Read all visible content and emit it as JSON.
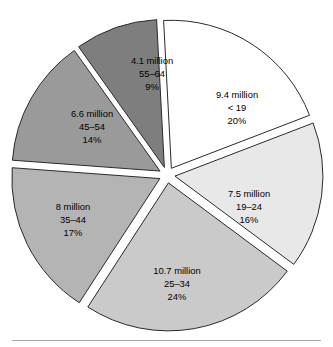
{
  "chart_data": {
    "type": "pie",
    "title": "",
    "subtitle": "",
    "xlabel": "",
    "ylabel": "",
    "legend_position": "none",
    "grid": false,
    "labels_inside_slices": true,
    "exploded": true,
    "units": "million",
    "categories": [
      "< 19",
      "19–24",
      "25–34",
      "35–44",
      "45–54",
      "55–64"
    ],
    "values": [
      9.4,
      7.5,
      10.7,
      8,
      6.6,
      4.1
    ],
    "percentages": [
      20,
      16,
      24,
      17,
      14,
      9
    ],
    "colors": [
      "#ffffff",
      "#e8e8e8",
      "#cacaca",
      "#b4b4b4",
      "#9a9a9a",
      "#7e7e7e"
    ],
    "slices": [
      {
        "id": "under-19",
        "value_label": "9.4 million",
        "category_label": "< 19",
        "percent_label": "20%",
        "value": 9.4,
        "percent": 20,
        "color": "#ffffff",
        "start_angle": -3,
        "end_angle": 69,
        "label_x": 237,
        "label_y": 96
      },
      {
        "id": "age-19-24",
        "value_label": "7.5 million",
        "category_label": "19–24",
        "percent_label": "16%",
        "value": 7.5,
        "percent": 16,
        "color": "#e8e8e8",
        "start_angle": 69,
        "end_angle": 126.6,
        "label_x": 249,
        "label_y": 195
      },
      {
        "id": "age-25-34",
        "value_label": "10.7 million",
        "category_label": "25–34",
        "percent_label": "24%",
        "value": 10.7,
        "percent": 24,
        "color": "#cacaca",
        "start_angle": 126.6,
        "end_angle": 213,
        "label_x": 177,
        "label_y": 272
      },
      {
        "id": "age-35-44",
        "value_label": "8 million",
        "category_label": "35–44",
        "percent_label": "17%",
        "value": 8,
        "percent": 17,
        "color": "#b4b4b4",
        "start_angle": 213,
        "end_angle": 274.2,
        "label_x": 73,
        "label_y": 208
      },
      {
        "id": "age-45-54",
        "value_label": "6.6 million",
        "category_label": "45–54",
        "percent_label": "14%",
        "value": 6.6,
        "percent": 14,
        "color": "#9a9a9a",
        "start_angle": 274.2,
        "end_angle": 324.6,
        "label_x": 92,
        "label_y": 115
      },
      {
        "id": "age-55-64",
        "value_label": "4.1 million",
        "category_label": "55–64",
        "percent_label": "9%",
        "value": 4.1,
        "percent": 9,
        "color": "#7e7e7e",
        "start_angle": 324.6,
        "end_angle": 357,
        "label_x": 152,
        "label_y": 62
      }
    ],
    "geometry": {
      "center_x": 167,
      "center_y": 175,
      "radius": 148,
      "explode_offset": 8
    }
  }
}
